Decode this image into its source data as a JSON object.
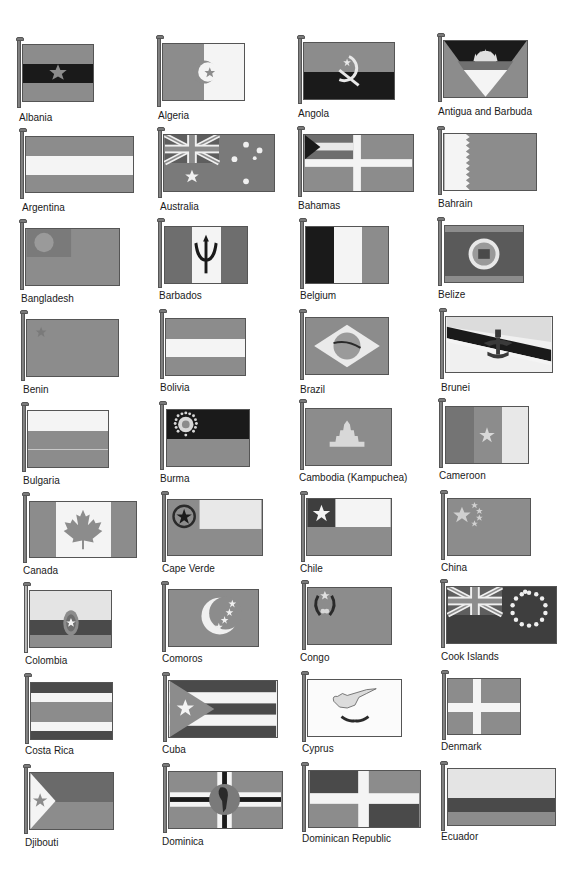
{
  "page": {
    "type": "flags-of-the-world-reference-page",
    "columns": 4,
    "rows": 9
  },
  "flags": [
    {
      "name": "Albania"
    },
    {
      "name": "Algeria"
    },
    {
      "name": "Angola"
    },
    {
      "name": "Antigua and Barbuda"
    },
    {
      "name": "Argentina"
    },
    {
      "name": "Australia"
    },
    {
      "name": "Bahamas"
    },
    {
      "name": "Bahrain"
    },
    {
      "name": "Bangladesh"
    },
    {
      "name": "Barbados"
    },
    {
      "name": "Belgium"
    },
    {
      "name": "Belize"
    },
    {
      "name": "Benin"
    },
    {
      "name": "Bolivia"
    },
    {
      "name": "Brazil"
    },
    {
      "name": "Brunei"
    },
    {
      "name": "Bulgaria"
    },
    {
      "name": "Burma"
    },
    {
      "name": "Cambodia (Kampuchea)"
    },
    {
      "name": "Cameroon"
    },
    {
      "name": "Canada"
    },
    {
      "name": "Cape Verde"
    },
    {
      "name": "Chile"
    },
    {
      "name": "China"
    },
    {
      "name": "Colombia"
    },
    {
      "name": "Comoros"
    },
    {
      "name": "Congo"
    },
    {
      "name": "Cook Islands"
    },
    {
      "name": "Costa Rica"
    },
    {
      "name": "Cuba"
    },
    {
      "name": "Cyprus"
    },
    {
      "name": "Denmark"
    },
    {
      "name": "Djibouti"
    },
    {
      "name": "Dominica"
    },
    {
      "name": "Dominican Republic"
    },
    {
      "name": "Ecuador"
    }
  ],
  "colors": {
    "page_bg": "#ffffff",
    "flag_gray": "#8c8c8c",
    "flag_dark": "#1a1a1a",
    "flag_mid": "#5e5e5e",
    "flag_light": "#c4c4c4",
    "flag_white": "#f4f4f4",
    "label_text": "#1a1a1a"
  }
}
